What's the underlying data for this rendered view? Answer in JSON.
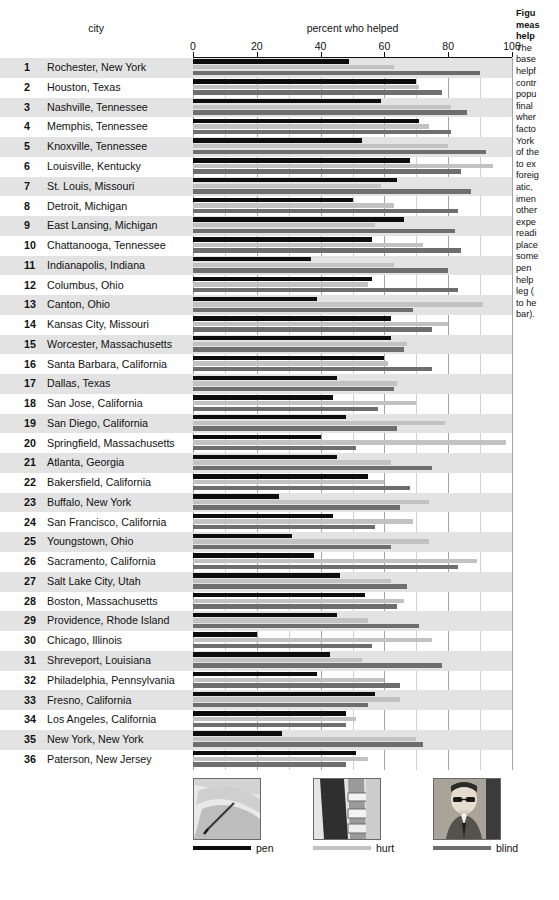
{
  "headers": {
    "city": "city",
    "measure": "percent who helped"
  },
  "axis": {
    "ticks": [
      "0",
      "20",
      "40",
      "60",
      "80",
      "100"
    ],
    "min": 0,
    "max": 100
  },
  "legend": {
    "items": [
      {
        "key": "pen",
        "label": "pen",
        "color": "#0d0d0d",
        "photo": "dropped-pen-photo"
      },
      {
        "key": "hurt",
        "label": "hurt",
        "color": "#c2c2c2",
        "photo": "hurt-leg-photo"
      },
      {
        "key": "blind",
        "label": "blind",
        "color": "#6e6e6e",
        "photo": "blind-man-photo"
      }
    ]
  },
  "caption": {
    "title_lines": [
      "Figu",
      "meas",
      "help"
    ],
    "body_lines": [
      "The",
      "base",
      "helpf",
      "contr",
      "popu",
      "final",
      "wher",
      "facto",
      "York",
      "of the",
      "to ex",
      "foreig",
      "atic, ",
      "imen",
      "other",
      "expe",
      "readi",
      "place",
      "some",
      "pen",
      "help",
      "leg (",
      "to he",
      "bar)."
    ]
  },
  "chart_data": {
    "type": "bar",
    "title": "percent who helped",
    "xlabel": "percent who helped",
    "ylabel": "city",
    "xlim": [
      0,
      100
    ],
    "grid": true,
    "orientation": "horizontal",
    "legend_position": "bottom",
    "categories": [
      "Rochester, New York",
      "Houston, Texas",
      "Nashville, Tennessee",
      "Memphis, Tennessee",
      "Knoxville, Tennessee",
      "Louisville, Kentucky",
      "St. Louis, Missouri",
      "Detroit, Michigan",
      "East Lansing, Michigan",
      "Chattanooga, Tennessee",
      "Indianapolis, Indiana",
      "Columbus, Ohio",
      "Canton, Ohio",
      "Kansas City, Missouri",
      "Worcester, Massachusetts",
      "Santa Barbara, California",
      "Dallas, Texas",
      "San Jose, California",
      "San Diego, California",
      "Springfield, Massachusetts",
      "Atlanta, Georgia",
      "Bakersfield, California",
      "Buffalo, New York",
      "San Francisco, California",
      "Youngstown, Ohio",
      "Sacramento, California",
      "Salt Lake City, Utah",
      "Boston, Massachusetts",
      "Providence, Rhode Island",
      "Chicago, Illinois",
      "Shreveport, Louisiana",
      "Philadelphia, Pennsylvania",
      "Fresno, California",
      "Los Angeles, California",
      "New York, New York",
      "Paterson, New Jersey"
    ],
    "ranks": [
      1,
      2,
      3,
      4,
      5,
      6,
      7,
      8,
      9,
      10,
      11,
      12,
      13,
      14,
      15,
      16,
      17,
      18,
      19,
      20,
      21,
      22,
      23,
      24,
      25,
      26,
      27,
      28,
      29,
      30,
      31,
      32,
      33,
      34,
      35,
      36
    ],
    "series": [
      {
        "name": "pen",
        "color": "#0d0d0d",
        "values": [
          49,
          70,
          59,
          71,
          53,
          68,
          64,
          50,
          66,
          56,
          37,
          56,
          39,
          62,
          62,
          60,
          45,
          44,
          48,
          40,
          45,
          55,
          27,
          44,
          31,
          38,
          46,
          54,
          45,
          20,
          43,
          39,
          57,
          48,
          28,
          51
        ]
      },
      {
        "name": "hurt",
        "color": "#c2c2c2",
        "values": [
          63,
          71,
          81,
          74,
          80,
          94,
          59,
          63,
          57,
          72,
          63,
          55,
          91,
          80,
          67,
          61,
          64,
          70,
          79,
          98,
          62,
          60,
          74,
          69,
          74,
          89,
          62,
          66,
          55,
          75,
          53,
          60,
          65,
          51,
          70,
          55
        ]
      },
      {
        "name": "blind",
        "color": "#6e6e6e",
        "values": [
          90,
          78,
          86,
          81,
          92,
          84,
          87,
          83,
          82,
          84,
          80,
          83,
          69,
          75,
          66,
          75,
          63,
          58,
          64,
          51,
          75,
          68,
          65,
          57,
          62,
          83,
          67,
          64,
          71,
          56,
          78,
          65,
          55,
          48,
          72,
          48
        ]
      }
    ]
  }
}
